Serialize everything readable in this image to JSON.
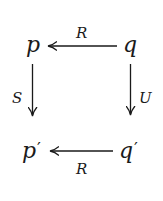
{
  "diagram": {
    "type": "commutative-square",
    "nodes": {
      "top_left": "p",
      "top_right": "q",
      "bottom_left": "p",
      "bottom_left_prime": "′",
      "bottom_right": "q",
      "bottom_right_prime": "′"
    },
    "arrows": [
      {
        "from": "q",
        "to": "p",
        "label": "R",
        "position": "top"
      },
      {
        "from": "p",
        "to": "p′",
        "label": "S",
        "position": "left"
      },
      {
        "from": "q",
        "to": "q′",
        "label": "U",
        "position": "right"
      },
      {
        "from": "q′",
        "to": "p′",
        "label": "R",
        "position": "bottom"
      }
    ],
    "labels": {
      "top": "R",
      "left": "S",
      "right": "U",
      "bottom": "R"
    },
    "colors": {
      "ink": "#1a1a1a",
      "background": "#ffffff"
    }
  }
}
